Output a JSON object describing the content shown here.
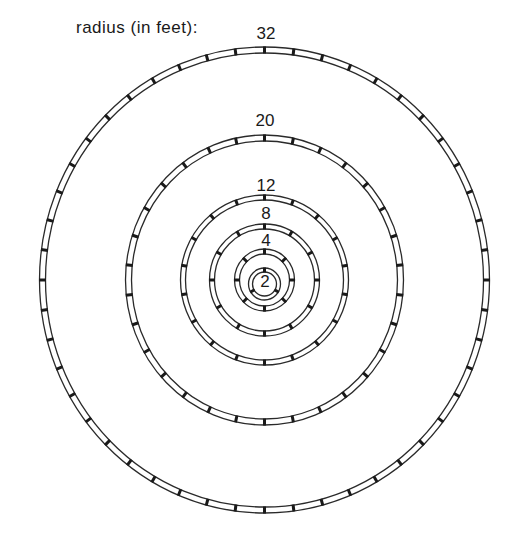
{
  "title": "radius (in feet):",
  "colors": {
    "line": "#2a2a2a",
    "text": "#1a1a1a",
    "background": "#ffffff"
  },
  "center": {
    "x": 264.5,
    "y": 280
  },
  "rings": [
    {
      "label": "32",
      "radius_ft": 32,
      "rx": 225,
      "ry": 233,
      "gap": 6,
      "ticks": 48,
      "label_x": 266,
      "label_y": 39
    },
    {
      "label": "20",
      "radius_ft": 20,
      "rx": 139,
      "ry": 145,
      "gap": 6,
      "ticks": 30,
      "label_x": 265,
      "label_y": 126
    },
    {
      "label": "12",
      "radius_ft": 12,
      "rx": 84,
      "ry": 85,
      "gap": 5,
      "ticks": 18,
      "label_x": 266,
      "label_y": 191
    },
    {
      "label": "8",
      "radius_ft": 8,
      "rx": 55,
      "ry": 56,
      "gap": 5,
      "ticks": 12,
      "label_x": 266,
      "label_y": 219
    },
    {
      "label": "4",
      "radius_ft": 4,
      "rx": 30,
      "ry": 31,
      "gap": 5,
      "ticks": 8,
      "label_x": 266,
      "label_y": 246
    },
    {
      "label": "2",
      "radius_ft": 2,
      "rx": 16,
      "ry": 16,
      "gap": 4,
      "ticks": 3,
      "label_x": 265,
      "label_y": 283,
      "label_inside": true,
      "center_y": 284
    }
  ]
}
